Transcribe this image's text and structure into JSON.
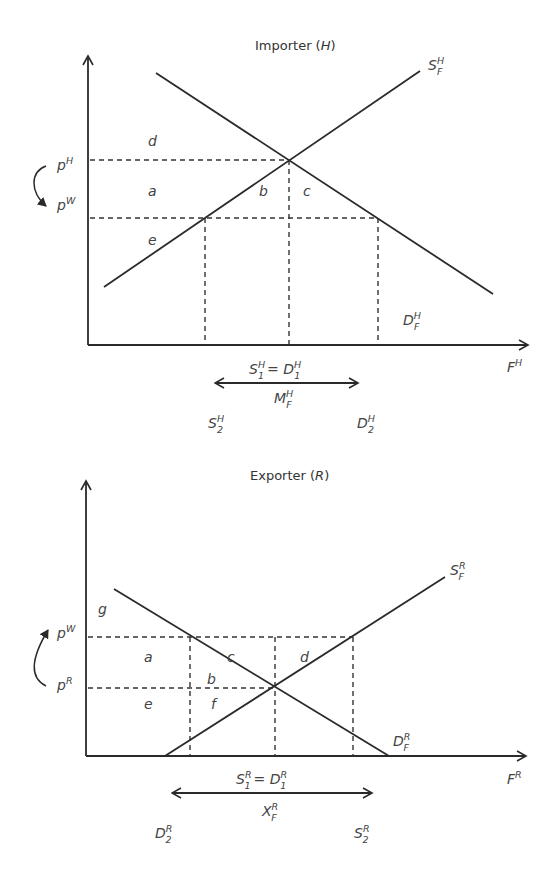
{
  "top": {
    "title": "Importer (",
    "title_var": "H",
    "title_close": ")",
    "supply_label": {
      "base": "S",
      "sup": "H",
      "sub": "F"
    },
    "demand_label": {
      "base": "D",
      "sup": "H",
      "sub": "F"
    },
    "x_axis_label": {
      "base": "F",
      "sup": "H"
    },
    "price_high": {
      "base": "p",
      "sup": "H"
    },
    "price_low": {
      "base": "p",
      "sup": "W"
    },
    "areas": {
      "a": "a",
      "b": "b",
      "c": "c",
      "d": "d",
      "e": "e"
    },
    "eq_label": {
      "s": "S",
      "s_sup": "H",
      "s_sub": "1",
      "eq": "= ",
      "d": "D",
      "d_sup": "H",
      "d_sub": "1"
    },
    "trade_label": {
      "base": "M",
      "sup": "H",
      "sub": "F"
    },
    "left_qty": {
      "base": "S",
      "sup": "H",
      "sub": "2"
    },
    "right_qty": {
      "base": "D",
      "sup": "H",
      "sub": "2"
    }
  },
  "bottom": {
    "title": "Exporter (",
    "title_var": "R",
    "title_close": ")",
    "supply_label": {
      "base": "S",
      "sup": "R",
      "sub": "F"
    },
    "demand_label": {
      "base": "D",
      "sup": "R",
      "sub": "F"
    },
    "x_axis_label": {
      "base": "F",
      "sup": "R"
    },
    "price_high": {
      "base": "p",
      "sup": "W"
    },
    "price_low": {
      "base": "p",
      "sup": "R"
    },
    "areas": {
      "a": "a",
      "b": "b",
      "c": "c",
      "d": "d",
      "e": "e",
      "f": "f",
      "g": "g"
    },
    "eq_label": {
      "s": "S",
      "s_sup": "R",
      "s_sub": "1",
      "eq": "= ",
      "d": "D",
      "d_sup": "R",
      "d_sub": "1"
    },
    "trade_label": {
      "base": "X",
      "sup": "R",
      "sub": "F"
    },
    "left_qty": {
      "base": "D",
      "sup": "R",
      "sub": "2"
    },
    "right_qty": {
      "base": "S",
      "sup": "R",
      "sub": "2"
    }
  }
}
